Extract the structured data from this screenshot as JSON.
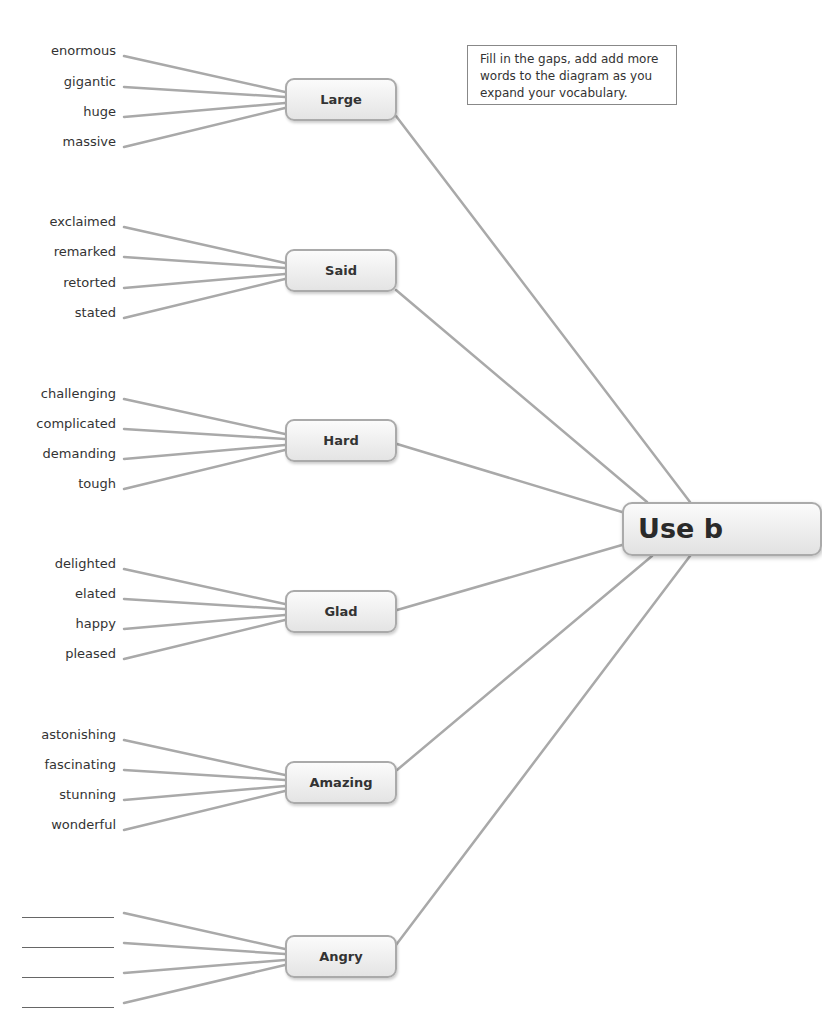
{
  "note": {
    "text": "Fill in the gaps, add add more words to the diagram as you expand your vocabulary."
  },
  "center": {
    "label": "Use b"
  },
  "groups": [
    {
      "label": "Large",
      "words": [
        "enormous",
        "gigantic",
        "huge",
        "massive"
      ]
    },
    {
      "label": "Said",
      "words": [
        "exclaimed",
        "remarked",
        "retorted",
        "stated"
      ]
    },
    {
      "label": "Hard",
      "words": [
        "challenging",
        "complicated",
        "demanding",
        "tough"
      ]
    },
    {
      "label": "Glad",
      "words": [
        "delighted",
        "elated",
        "happy",
        "pleased"
      ]
    },
    {
      "label": "Amazing",
      "words": [
        "astonishing",
        "fascinating",
        "stunning",
        "wonderful"
      ]
    },
    {
      "label": "Angry",
      "words": [
        "",
        "",
        "",
        ""
      ]
    }
  ],
  "colors": {
    "line": "#a9a9a9",
    "node_border": "#aaaaaa",
    "text": "#333333"
  }
}
